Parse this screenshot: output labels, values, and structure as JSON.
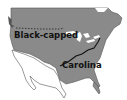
{
  "map": {
    "subject": "North American chickadee ranges",
    "labels": {
      "north": "Black-capped",
      "south": "Carolina"
    },
    "colors": {
      "range_fill": "#8a8a8a",
      "out_of_range": "#ffffff",
      "coast_outline": "#555555",
      "boundary_line": "#111111",
      "label": "#111111"
    },
    "legend_lines": {
      "dashed": "northern range limit",
      "solid": "species boundary"
    }
  }
}
